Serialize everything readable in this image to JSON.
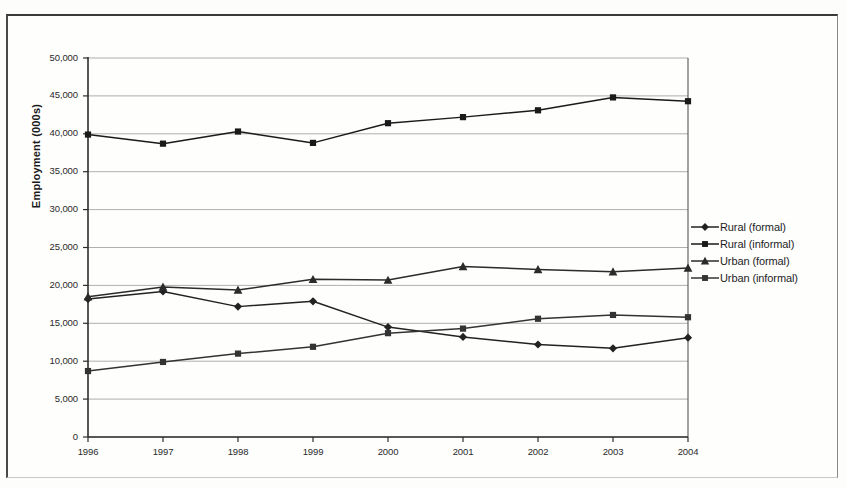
{
  "chart_data": {
    "type": "line",
    "title": "",
    "xlabel": "",
    "ylabel": "Employment (000s)",
    "categories": [
      "1996",
      "1997",
      "1998",
      "1999",
      "2000",
      "2001",
      "2002",
      "2003",
      "2004"
    ],
    "x": [
      1996,
      1997,
      1998,
      1999,
      2000,
      2001,
      2002,
      2003,
      2004
    ],
    "ylim": [
      0,
      50000
    ],
    "xlim": [
      1996,
      2004
    ],
    "ytick_labels": [
      "50,000",
      "45,000",
      "40,000",
      "35,000",
      "30,000",
      "25,000",
      "20,000",
      "15,000",
      "10,000",
      "5,000",
      "0"
    ],
    "ytick_values": [
      50000,
      45000,
      40000,
      35000,
      30000,
      25000,
      20000,
      15000,
      10000,
      5000,
      0
    ],
    "ytick_step": 5000,
    "grid": true,
    "grid_axis": "y",
    "legend_position": "right",
    "series": [
      {
        "name": "Rural (formal)",
        "marker": "diamond",
        "color": "#222222",
        "values": [
          18200,
          19200,
          17200,
          17900,
          14500,
          13200,
          12200,
          11700,
          13100
        ]
      },
      {
        "name": "Rural (informal)",
        "marker": "square",
        "color": "#1a1a1a",
        "values": [
          39900,
          38700,
          40300,
          38800,
          41400,
          42200,
          43100,
          44800,
          44300
        ]
      },
      {
        "name": "Urban (formal)",
        "marker": "triangle",
        "color": "#2b2b2b",
        "values": [
          18500,
          19800,
          19400,
          20800,
          20700,
          22500,
          22100,
          21800,
          22300
        ]
      },
      {
        "name": "Urban (informal)",
        "marker": "square",
        "color": "#333333",
        "values": [
          8700,
          9900,
          11000,
          11900,
          13700,
          14300,
          15600,
          16100,
          15800
        ]
      }
    ]
  },
  "legend": {
    "items": [
      {
        "label": "Rural (formal)"
      },
      {
        "label": "Rural (informal)"
      },
      {
        "label": "Urban (formal)"
      },
      {
        "label": "Urban (informal)"
      }
    ]
  },
  "axes": {
    "y_title": "Employment (000s)"
  }
}
